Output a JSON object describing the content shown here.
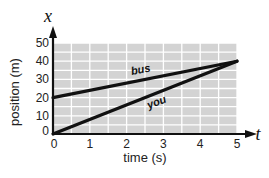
{
  "chart_data": {
    "type": "line",
    "title": "",
    "xlabel": "time (s)",
    "ylabel": "position (m)",
    "x_axis_variable": "t",
    "y_axis_variable": "x",
    "xlim": [
      0,
      5
    ],
    "ylim": [
      0,
      50
    ],
    "x_ticks": [
      "0",
      "1",
      "2",
      "3",
      "4",
      "5"
    ],
    "y_ticks": [
      "0",
      "10",
      "20",
      "30",
      "40",
      "50"
    ],
    "grid": true,
    "grid_minor_x_step": 0.5,
    "grid_minor_y_step": 5,
    "legend": "none (inline labels)",
    "series": [
      {
        "name": "bus",
        "x": [
          0,
          5
        ],
        "y": [
          20,
          40
        ]
      },
      {
        "name": "you",
        "x": [
          0,
          5
        ],
        "y": [
          0,
          40
        ]
      }
    ],
    "colors": {
      "plot_background": "#d3d3d3",
      "grid": "#ffffff",
      "line": "#111111",
      "axis": "#111111"
    }
  }
}
